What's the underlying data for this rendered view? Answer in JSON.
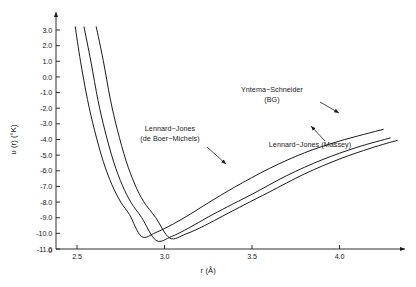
{
  "figure": {
    "name": "intermolecular-potential-plot",
    "background": "#ffffff",
    "ink": "#1a1a1a"
  },
  "chart_data": {
    "type": "line",
    "title": "",
    "subtitle": "",
    "xlabel": "r  (Å)",
    "ylabel": "υ (r)   (°K)",
    "xlim": [
      2.3,
      4.4
    ],
    "ylim": [
      -11.0,
      3.4
    ],
    "grid": false,
    "legend_position": "inline-annotations",
    "origin_label": "0",
    "xticks": [
      2.5,
      3.0,
      3.5,
      4.0
    ],
    "xtick_labels": [
      "2.5",
      "3.0",
      "3.5",
      "4.0"
    ],
    "yticks": [
      3.0,
      2.0,
      1.0,
      0.0,
      -1.0,
      -2.0,
      -3.0,
      -4.0,
      -5.0,
      -6.0,
      -7.0,
      -8.0,
      -9.0,
      -10.0,
      -11.0
    ],
    "ytick_labels": [
      "3.0",
      "2.0",
      "1.0",
      "0.0",
      "-1.0",
      "-2.0",
      "-3.0",
      "-4.0",
      "-5.0",
      "-6.0",
      "-7.0",
      "-8.0",
      "-9.0",
      "-10.0",
      "-11.0"
    ],
    "series": [
      {
        "name": "Lennard-Jones (de Boer-Michels)",
        "label": "Lennard−Jones",
        "label_line2": "(de  Boer−Michels)",
        "color": "#1a1a1a",
        "epsilon": 10.22,
        "sigma": 2.556,
        "r_min": 2.869,
        "v_min": -10.22,
        "x": [
          2.49,
          2.52,
          2.56,
          2.6,
          2.65,
          2.7,
          2.75,
          2.8,
          2.869,
          2.95,
          3.05,
          3.15,
          3.25,
          3.4,
          3.6,
          3.8,
          4.0,
          4.25
        ],
        "y": [
          3.2,
          1.0,
          -1.45,
          -3.4,
          -5.4,
          -6.9,
          -8.0,
          -8.8,
          -10.2,
          -9.95,
          -9.4,
          -8.75,
          -8.05,
          -7.05,
          -5.85,
          -4.85,
          -4.1,
          -3.35
        ]
      },
      {
        "name": "Lennard-Jones (Massey)",
        "label": "Lennard−Jones  (Massey)",
        "color": "#1a1a1a",
        "epsilon": 10.5,
        "sigma": 2.63,
        "r_min": 2.952,
        "v_min": -10.5,
        "x": [
          2.54,
          2.58,
          2.62,
          2.66,
          2.71,
          2.76,
          2.81,
          2.87,
          2.952,
          3.04,
          3.14,
          3.25,
          3.36,
          3.5,
          3.7,
          3.9,
          4.1,
          4.29
        ],
        "y": [
          3.2,
          0.95,
          -1.5,
          -3.45,
          -5.45,
          -6.95,
          -8.05,
          -9.0,
          -10.45,
          -10.2,
          -9.65,
          -8.95,
          -8.3,
          -7.5,
          -6.3,
          -5.3,
          -4.5,
          -3.9
        ]
      },
      {
        "name": "Yntema-Schneider (BG)",
        "label": "Yntema−Schneider",
        "label_line2": "(BG)",
        "color": "#1a1a1a",
        "epsilon": 10.35,
        "sigma": 2.7,
        "r_min": 3.03,
        "v_min": -10.35,
        "x": [
          2.61,
          2.65,
          2.69,
          2.73,
          2.78,
          2.83,
          2.88,
          2.95,
          3.03,
          3.12,
          3.23,
          3.34,
          3.46,
          3.6,
          3.8,
          4.0,
          4.18,
          4.33
        ],
        "y": [
          3.2,
          1.05,
          -1.4,
          -3.35,
          -5.35,
          -6.85,
          -7.95,
          -9.0,
          -10.3,
          -10.05,
          -9.5,
          -8.85,
          -8.15,
          -7.35,
          -6.2,
          -5.25,
          -4.55,
          -4.05
        ]
      }
    ],
    "annotations": [
      {
        "name": "yntema-schneider-annotation",
        "line1": "Yntema−Schneider",
        "line2": "(BG)",
        "text_x": 272,
        "text_y": 92,
        "arrow_from": [
          320,
          102
        ],
        "arrow_to": [
          339,
          113
        ]
      },
      {
        "name": "lennard-jones-de-boer-michels-annotation",
        "line1": "Lennard−Jones",
        "line2": "(de  Boer−Michels)",
        "text_x": 170,
        "text_y": 131,
        "arrow_from": [
          207,
          147
        ],
        "arrow_to": [
          226,
          164
        ]
      },
      {
        "name": "lennard-jones-massey-annotation",
        "line1": "Lennard−Jones  (Massey)",
        "line2": "",
        "text_x": 310,
        "text_y": 147,
        "arrow_from": [
          325,
          141
        ],
        "arrow_to": [
          311,
          126
        ]
      }
    ]
  }
}
